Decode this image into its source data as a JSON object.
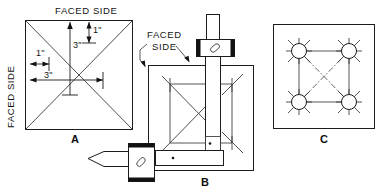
{
  "figure": {
    "title_visible": false,
    "background_color": "#ffffff",
    "line_color": "#1c1c1c",
    "panels": [
      {
        "id": "A",
        "label": "A",
        "type": "layout-square-top-view",
        "annotations": {
          "top_label": "FACED SIDE",
          "left_label": "FACED SIDE",
          "dimensions": [
            {
              "id": "dim-top-vertical-3in",
              "value": "3\"",
              "orientation": "vertical"
            },
            {
              "id": "dim-top-right-1in",
              "value": "1\"",
              "orientation": "vertical"
            },
            {
              "id": "dim-left-upper-1in",
              "value": "1\"",
              "orientation": "horizontal"
            },
            {
              "id": "dim-left-lower-3in",
              "value": "3\"",
              "orientation": "horizontal"
            }
          ]
        }
      },
      {
        "id": "B",
        "label": "B",
        "type": "workpiece-clamped-setup",
        "annotations": {
          "leader_label_line1": "FACED",
          "leader_label_line2": "SIDE",
          "leader_arrow_count": 2,
          "clamps": [
            {
              "id": "clamp-top",
              "position": "top"
            },
            {
              "id": "clamp-bottom-left",
              "position": "bottom-left"
            }
          ],
          "center_punch_marks": 2
        }
      },
      {
        "id": "C",
        "label": "C",
        "type": "drilled-hole-pattern",
        "annotations": {
          "hole_count": 4,
          "holes": [
            {
              "id": "hole-top-left",
              "position": "top-left"
            },
            {
              "id": "hole-top-right",
              "position": "top-right"
            },
            {
              "id": "hole-bottom-left",
              "position": "bottom-left"
            },
            {
              "id": "hole-bottom-right",
              "position": "bottom-right"
            }
          ],
          "diagonal_line_style": "dash-dot",
          "edge_line_style": "solid"
        }
      }
    ]
  }
}
